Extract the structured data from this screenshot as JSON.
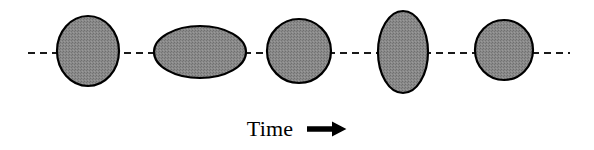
{
  "figure": {
    "caption_label": "Time",
    "caption_arrow_icon": "right-arrow-icon",
    "width": 594,
    "height": 150,
    "background_color": "#ffffff"
  },
  "axis": {
    "name": "time-axis",
    "style": "dashed",
    "orientation": "horizontal",
    "y": 53,
    "x_start": 28,
    "x_end": 570,
    "dash_length": 7,
    "gap_length": 5,
    "stroke_width": 2.2,
    "color": "#1a1a1a"
  },
  "shapes": {
    "fill_color": "#808080",
    "stroke_color": "#000000",
    "stroke_width": 2.2,
    "count": 5,
    "items": [
      {
        "index": 1,
        "name": "blob-1",
        "label": "circle",
        "cx": 88,
        "cy": 51,
        "rx": 31,
        "ry": 35,
        "rotation": 0
      },
      {
        "index": 2,
        "name": "blob-2",
        "label": "horizontal-ellipse",
        "cx": 200,
        "cy": 52,
        "rx": 46,
        "ry": 26,
        "rotation": 0
      },
      {
        "index": 3,
        "name": "blob-3",
        "label": "circle",
        "cx": 299,
        "cy": 51,
        "rx": 32,
        "ry": 32,
        "rotation": 0
      },
      {
        "index": 4,
        "name": "blob-4",
        "label": "vertical-ellipse",
        "cx": 403,
        "cy": 52,
        "rx": 25,
        "ry": 41,
        "rotation": 0
      },
      {
        "index": 5,
        "name": "blob-5",
        "label": "circle",
        "cx": 504,
        "cy": 50,
        "rx": 29,
        "ry": 30,
        "rotation": 0
      }
    ]
  },
  "chart_data": {
    "type": "scatter",
    "title": "",
    "xlabel": "Time",
    "ylabel": "",
    "categories": [
      "t1",
      "t2",
      "t3",
      "t4",
      "t5"
    ],
    "series": [
      {
        "name": "semi-axis-horizontal",
        "values": [
          31,
          46,
          32,
          25,
          29
        ]
      },
      {
        "name": "semi-axis-vertical",
        "values": [
          35,
          26,
          32,
          41,
          30
        ]
      }
    ],
    "annotations": [
      "Time"
    ],
    "grid": false,
    "legend": "none"
  }
}
